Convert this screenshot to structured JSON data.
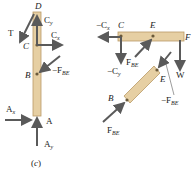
{
  "figure": {
    "caption": "(c)",
    "colors": {
      "member_fill": "#e6cfa3",
      "member_stroke": "#b99a66",
      "arrow": "#5a5a5a",
      "text": "#222222"
    },
    "member_ABD": {
      "points": [
        "D",
        "C",
        "B",
        "A"
      ],
      "forces": [
        {
          "label": "T",
          "direction": "down-left from D"
        },
        {
          "label": "C",
          "sub": "y",
          "direction": "up at C"
        },
        {
          "label": "C",
          "sub": "x",
          "direction": "right at C"
        },
        {
          "label": "−F",
          "sub": "BE",
          "direction": "down-left into B"
        },
        {
          "label": "A",
          "sub": "x",
          "direction": "right into A"
        },
        {
          "label": "A",
          "sub": "y",
          "direction": "up into A"
        }
      ]
    },
    "member_CEF": {
      "points": [
        "C",
        "E",
        "F"
      ],
      "forces": [
        {
          "label": "−C",
          "sub": "x",
          "direction": "left at C"
        },
        {
          "label": "−C",
          "sub": "y",
          "direction": "down at C"
        },
        {
          "label": "F",
          "sub": "BE",
          "direction": "up-right into E"
        },
        {
          "label": "W",
          "direction": "down at F"
        }
      ]
    },
    "member_BE": {
      "points": [
        "B",
        "E"
      ],
      "forces": [
        {
          "label": "F",
          "sub": "BE",
          "direction": "up-right into B"
        },
        {
          "label": "−F",
          "sub": "BE",
          "direction": "down-left into E"
        }
      ]
    }
  }
}
